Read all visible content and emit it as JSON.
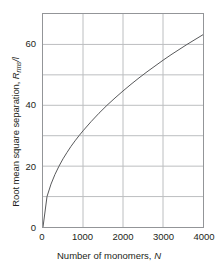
{
  "chart_data": {
    "type": "line",
    "title": "",
    "xlabel": "Number of monomers, N",
    "xlabel_text": "Number of monomers, ",
    "xlabel_var": "N",
    "ylabel_text": "Root mean square separation, ",
    "ylabel_var": "R",
    "ylabel_sub": "rms",
    "ylabel_tail": "/l",
    "ylabel": "Root mean square separation, R_rms/l",
    "xlim": [
      0,
      4000
    ],
    "ylim": [
      0,
      70
    ],
    "grid": true,
    "legend": "none",
    "xticks": [
      0,
      1000,
      2000,
      3000,
      4000
    ],
    "xtick_labels": [
      "0",
      "1000",
      "2000",
      "3000",
      "4000"
    ],
    "yticks": [
      0,
      20,
      40,
      60
    ],
    "ytick_labels": [
      "0",
      "20",
      "40",
      "60"
    ],
    "y_gridlines": [
      10,
      20,
      30,
      40,
      50,
      60
    ],
    "x_gridlines": [
      1000,
      2000,
      3000
    ],
    "series": [
      {
        "name": "Rrms/l = sqrt(N)",
        "color": "#58595b",
        "x": [
          0,
          100,
          200,
          300,
          400,
          500,
          600,
          700,
          800,
          900,
          1000,
          1200,
          1400,
          1600,
          1800,
          2000,
          2200,
          2400,
          2600,
          2800,
          3000,
          3200,
          3400,
          3600,
          3800,
          4000
        ],
        "values": [
          0.0,
          10.0,
          14.1,
          17.3,
          20.0,
          22.4,
          24.5,
          26.5,
          28.3,
          30.0,
          31.6,
          34.6,
          37.4,
          40.0,
          42.4,
          44.7,
          46.9,
          49.0,
          51.0,
          52.9,
          54.8,
          56.6,
          58.3,
          60.0,
          61.6,
          63.2
        ]
      }
    ]
  },
  "axes": {
    "frame_color": "#939598",
    "grid_color": "#bcbec0",
    "text_color": "#231f20"
  }
}
